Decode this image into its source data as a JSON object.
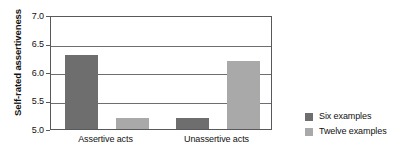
{
  "chart_data": {
    "type": "bar",
    "title": "",
    "xlabel": "",
    "ylabel": "Self-rated assertiveness",
    "categories": [
      "Assertive acts",
      "Unassertive acts"
    ],
    "series": [
      {
        "name": "Six examples",
        "values": [
          6.3,
          5.2
        ],
        "color": "#6e6e6e"
      },
      {
        "name": "Twelve examples",
        "values": [
          5.2,
          6.2
        ],
        "color": "#a9a9a9"
      }
    ],
    "ylim": [
      5.0,
      7.0
    ],
    "yticks": [
      "7.0",
      "6.5",
      "6.0",
      "5.5",
      "5.0"
    ],
    "ytick_values": [
      7.0,
      6.5,
      6.0,
      5.5,
      5.0
    ],
    "grid": true,
    "legend_position": "right"
  },
  "legend": {
    "entries": [
      {
        "label": "Six examples"
      },
      {
        "label": "Twelve examples"
      }
    ]
  },
  "axes": {
    "y_title": "Self-rated assertiveness",
    "x_categories": [
      "Assertive acts",
      "Unassertive acts"
    ],
    "y_tick_labels": [
      "7.0",
      "6.5",
      "6.0",
      "5.5",
      "5.0"
    ]
  },
  "colors": {
    "series_six": "#6e6e6e",
    "series_twelve": "#a9a9a9",
    "axis": "#58595b",
    "grid": "#6d6e71",
    "background": "#ffffff"
  }
}
